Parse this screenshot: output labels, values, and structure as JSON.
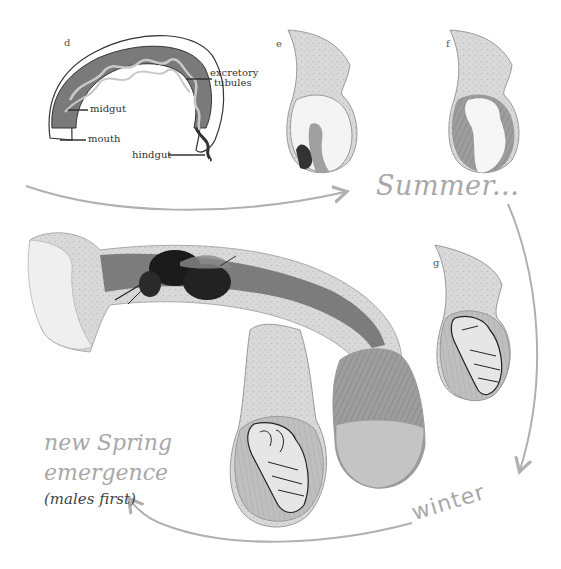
{
  "figure": {
    "panels": {
      "d": {
        "letter": "d",
        "labels": {
          "excretory": "excretory",
          "tubules": "tubules",
          "midgut": "midgut",
          "mouth": "mouth",
          "hindgut": "hindgut"
        }
      },
      "e": {
        "letter": "e"
      },
      "f": {
        "letter": "f"
      },
      "g": {
        "letter": "g"
      }
    },
    "seasons": {
      "summer": "Summer...",
      "winter": "winter",
      "spring_line1": "new Spring",
      "spring_line2": "emergence",
      "spring_note": "(males first)"
    },
    "colors": {
      "arrow": "#b0b0b0",
      "season_text": "#a8a8a8",
      "gut": "#7a7a7a",
      "tubules": "#c8c8c8",
      "cell_wall": "#cfcfcf",
      "pollen": "#9a9a9a",
      "bee": "#1a1a1a"
    }
  }
}
